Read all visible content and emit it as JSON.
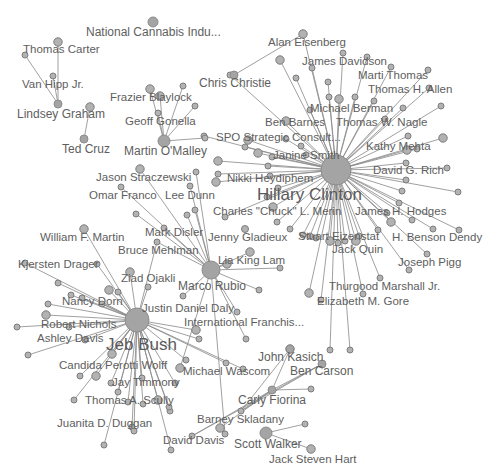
{
  "diagram": {
    "type": "network-graph",
    "colors": {
      "node_fill": "#b2b2b2",
      "node_stroke": "#7c7c7c",
      "edge": "#8a8a8a",
      "label": "#5e5e5e",
      "background": "#ffffff"
    },
    "hubs": [
      {
        "id": "clinton",
        "label": "Hillary Clinton",
        "x": 336,
        "y": 170,
        "r": 15,
        "lx": 257,
        "ly": 200,
        "size": "big"
      },
      {
        "id": "bush",
        "label": "Jeb Bush",
        "x": 137,
        "y": 320,
        "r": 12,
        "lx": 106,
        "ly": 350,
        "size": "big"
      },
      {
        "id": "rubio",
        "label": "Marco Rubio",
        "x": 211,
        "y": 270,
        "r": 9,
        "lx": 178,
        "ly": 290,
        "size": "mid"
      },
      {
        "id": "omalley",
        "label": "Martin O'Malley",
        "x": 164,
        "y": 141,
        "r": 6,
        "lx": 124,
        "ly": 155,
        "size": "mid"
      },
      {
        "id": "graham",
        "label": "Lindsey Graham",
        "x": 58,
        "y": 104,
        "r": 4,
        "lx": 17,
        "ly": 118,
        "size": "mid"
      },
      {
        "id": "cruz",
        "label": "Ted Cruz",
        "x": 84,
        "y": 139,
        "r": 4,
        "lx": 62,
        "ly": 153,
        "size": "mid"
      },
      {
        "id": "christie",
        "label": "Chris Christie",
        "x": 234,
        "y": 75,
        "r": 4,
        "lx": 199,
        "ly": 87,
        "size": "mid"
      },
      {
        "id": "fiorina",
        "label": "Carly Fiorina",
        "x": 272,
        "y": 390,
        "r": 4,
        "lx": 238,
        "ly": 404,
        "size": "mid"
      },
      {
        "id": "walker",
        "label": "Scott Walker",
        "x": 266,
        "y": 433,
        "r": 6,
        "lx": 234,
        "ly": 448,
        "size": "mid"
      },
      {
        "id": "kasich",
        "label": "John Kasich",
        "x": 290,
        "y": 349,
        "r": 4,
        "lx": 258,
        "ly": 361,
        "size": "mid"
      },
      {
        "id": "carson",
        "label": "Ben Carson",
        "x": 322,
        "y": 364,
        "r": 4,
        "lx": 290,
        "ly": 375,
        "size": "mid"
      },
      {
        "id": "cannabis",
        "label": "National Cannabis Indu...",
        "x": 153,
        "y": 22,
        "r": 5,
        "lx": 86,
        "ly": 36,
        "size": "mid"
      }
    ],
    "labels": [
      {
        "text": "Thomas Carter",
        "x": 23,
        "y": 53,
        "node": [
          58,
          42
        ]
      },
      {
        "text": "Van Hipp Jr.",
        "x": 22,
        "y": 88,
        "node": [
          53,
          76
        ]
      },
      {
        "text": "Frazier Blaylock",
        "x": 110,
        "y": 101,
        "node": [
          150,
          89
        ]
      },
      {
        "text": "Geoff Gonella",
        "x": 125,
        "y": 125,
        "node": [
          158,
          113
        ]
      },
      {
        "text": "SPO Strategic Consult...",
        "x": 216,
        "y": 141,
        "node": [
          204,
          136
        ]
      },
      {
        "text": "Alan Eisenberg",
        "x": 268,
        "y": 46,
        "node": [
          303,
          34
        ]
      },
      {
        "text": "James Davidson",
        "x": 302,
        "y": 65,
        "node": [
          343,
          53
        ]
      },
      {
        "text": "Marti Thomas",
        "x": 358,
        "y": 79,
        "node": [
          391,
          67
        ]
      },
      {
        "text": "Thomas H. Allen",
        "x": 368,
        "y": 93,
        "node": [
          429,
          88
        ]
      },
      {
        "text": "Michael Berman",
        "x": 310,
        "y": 112,
        "node": [
          310,
          110
        ]
      },
      {
        "text": "Ben Barnes",
        "x": 265,
        "y": 126,
        "node": [
          286,
          121
        ]
      },
      {
        "text": "Thomas W. Nagle",
        "x": 336,
        "y": 126,
        "node": [
          385,
          119
        ]
      },
      {
        "text": "Kathy Mehta",
        "x": 366,
        "y": 150,
        "node": [
          417,
          149
        ]
      },
      {
        "text": "Janine Smith",
        "x": 273,
        "y": 159,
        "node": [
          272,
          157
        ]
      },
      {
        "text": "David G. Rich",
        "x": 373,
        "y": 174,
        "node": [
          447,
          168
        ]
      },
      {
        "text": "Nikki Heydiphem",
        "x": 227,
        "y": 182,
        "node": [
          216,
          182
        ]
      },
      {
        "text": "Charles \"Chuck\" L. Merin",
        "x": 213,
        "y": 215,
        "node": [
          225,
          217
        ]
      },
      {
        "text": "James H. Hodges",
        "x": 355,
        "y": 215,
        "node": [
          387,
          213
        ]
      },
      {
        "text": "Jenny Gladieux",
        "x": 208,
        "y": 241,
        "node": [
          245,
          229
        ]
      },
      {
        "text": "Stuart Eizenstat",
        "x": 298,
        "y": 240,
        "node": [
          310,
          236
        ]
      },
      {
        "text": "H. Benson Dendy",
        "x": 392,
        "y": 241,
        "node": [
          433,
          229
        ]
      },
      {
        "text": "Jack Quin",
        "x": 332,
        "y": 253,
        "node": [
          356,
          241
        ]
      },
      {
        "text": "Lia King Lam",
        "x": 218,
        "y": 264,
        "node": [
          250,
          252
        ]
      },
      {
        "text": "Joseph Pigg",
        "x": 398,
        "y": 266,
        "node": [
          427,
          254
        ]
      },
      {
        "text": "Thurgood Marshall Jr.",
        "x": 329,
        "y": 290,
        "node": [
          380,
          278
        ]
      },
      {
        "text": "Elizabeth M. Gore",
        "x": 317,
        "y": 305,
        "node": [
          363,
          294
        ]
      },
      {
        "text": "Jason Straczewski",
        "x": 96,
        "y": 181,
        "node": [
          140,
          169
        ]
      },
      {
        "text": "Omar Franco",
        "x": 89,
        "y": 199,
        "node": [
          121,
          187
        ]
      },
      {
        "text": "Lee Dunn",
        "x": 165,
        "y": 199,
        "node": [
          190,
          186
        ]
      },
      {
        "text": "Mark Disler",
        "x": 145,
        "y": 236,
        "node": [
          187,
          215
        ]
      },
      {
        "text": "William F. Martin",
        "x": 40,
        "y": 241,
        "node": [
          84,
          229
        ]
      },
      {
        "text": "Bruce Mehlman",
        "x": 118,
        "y": 254,
        "node": [
          157,
          242
        ]
      },
      {
        "text": "Kjersten Drager",
        "x": 18,
        "y": 268,
        "node": [
          97,
          264
        ]
      },
      {
        "text": "Ziad Ojakli",
        "x": 121,
        "y": 282,
        "node": [
          130,
          272
        ]
      },
      {
        "text": "Nancy Dorn",
        "x": 62,
        "y": 305,
        "node": [
          71,
          295
        ]
      },
      {
        "text": "Justin Daniel Daly",
        "x": 142,
        "y": 312,
        "node": [
          183,
          296
        ]
      },
      {
        "text": "International Franchis...",
        "x": 184,
        "y": 326,
        "node": [
          237,
          312
        ]
      },
      {
        "text": "Robert Nichols",
        "x": 41,
        "y": 328,
        "node": [
          69,
          327
        ]
      },
      {
        "text": "Ashley Davis",
        "x": 37,
        "y": 342,
        "node": [
          85,
          340
        ]
      },
      {
        "text": "Candida Perotti Wolff",
        "x": 59,
        "y": 369,
        "node": [
          112,
          354
        ]
      },
      {
        "text": "Michael Wascom",
        "x": 183,
        "y": 375,
        "node": [
          226,
          363
        ]
      },
      {
        "text": "Jay Timmony",
        "x": 112,
        "y": 386,
        "node": [
          175,
          383
        ]
      },
      {
        "text": "Thomas A. Scully",
        "x": 85,
        "y": 404,
        "node": [
          74,
          400
        ]
      },
      {
        "text": "Juanita D. Duggan",
        "x": 57,
        "y": 427,
        "node": [
          132,
          427
        ]
      },
      {
        "text": "Barney Skladany",
        "x": 197,
        "y": 423,
        "node": [
          241,
          411
        ]
      },
      {
        "text": "David Davis",
        "x": 163,
        "y": 444,
        "node": [
          192,
          436
        ]
      },
      {
        "text": "Jack Steven Hart",
        "x": 269,
        "y": 463,
        "node": [
          311,
          449
        ]
      }
    ],
    "hub_edges": {
      "clinton": [
        [
          303,
          34
        ],
        [
          343,
          53
        ],
        [
          391,
          67
        ],
        [
          429,
          88
        ],
        [
          310,
          110
        ],
        [
          286,
          121
        ],
        [
          385,
          119
        ],
        [
          417,
          149
        ],
        [
          272,
          157
        ],
        [
          447,
          168
        ],
        [
          216,
          182
        ],
        [
          225,
          217
        ],
        [
          387,
          213
        ],
        [
          310,
          236
        ],
        [
          433,
          229
        ],
        [
          356,
          241
        ],
        [
          427,
          254
        ],
        [
          380,
          278
        ],
        [
          363,
          294
        ],
        [
          204,
          136
        ],
        [
          280,
          60
        ],
        [
          367,
          57
        ],
        [
          328,
          82
        ],
        [
          428,
          70
        ],
        [
          441,
          106
        ],
        [
          443,
          138
        ],
        [
          458,
          192
        ],
        [
          459,
          230
        ],
        [
          412,
          220
        ],
        [
          409,
          270
        ],
        [
          248,
          140
        ],
        [
          230,
          75
        ],
        [
          296,
          78
        ],
        [
          312,
          68
        ],
        [
          329,
          97
        ],
        [
          339,
          99
        ],
        [
          355,
          97
        ],
        [
          374,
          101
        ],
        [
          403,
          108
        ],
        [
          408,
          136
        ],
        [
          407,
          150
        ],
        [
          406,
          163
        ],
        [
          406,
          180
        ],
        [
          402,
          191
        ],
        [
          399,
          203
        ],
        [
          391,
          222
        ],
        [
          378,
          230
        ],
        [
          359,
          236
        ],
        [
          345,
          241
        ],
        [
          338,
          243
        ],
        [
          330,
          241
        ],
        [
          316,
          238
        ],
        [
          303,
          235
        ],
        [
          290,
          229
        ],
        [
          277,
          222
        ],
        [
          273,
          207
        ],
        [
          267,
          197
        ],
        [
          278,
          188
        ],
        [
          270,
          176
        ],
        [
          268,
          166
        ],
        [
          258,
          153
        ],
        [
          245,
          147
        ],
        [
          301,
          146
        ],
        [
          306,
          155
        ],
        [
          286,
          139
        ],
        [
          218,
          161
        ],
        [
          218,
          174
        ],
        [
          350,
          350
        ],
        [
          330,
          350
        ],
        [
          321,
          300
        ],
        [
          309,
          293
        ]
      ],
      "bush": [
        [
          84,
          229
        ],
        [
          97,
          264
        ],
        [
          71,
          295
        ],
        [
          69,
          327
        ],
        [
          85,
          340
        ],
        [
          112,
          354
        ],
        [
          175,
          383
        ],
        [
          74,
          400
        ],
        [
          132,
          427
        ],
        [
          226,
          363
        ],
        [
          130,
          272
        ],
        [
          157,
          242
        ],
        [
          25,
          263
        ],
        [
          17,
          327
        ],
        [
          28,
          355
        ],
        [
          46,
          315
        ],
        [
          48,
          304
        ],
        [
          82,
          298
        ],
        [
          58,
          283
        ],
        [
          80,
          376
        ],
        [
          96,
          376
        ],
        [
          111,
          383
        ],
        [
          118,
          392
        ],
        [
          128,
          402
        ],
        [
          143,
          404
        ],
        [
          158,
          400
        ],
        [
          170,
          411
        ],
        [
          134,
          431
        ],
        [
          104,
          445
        ],
        [
          171,
          450
        ],
        [
          196,
          330
        ],
        [
          199,
          339
        ],
        [
          142,
          378
        ],
        [
          186,
          360
        ],
        [
          243,
          369
        ],
        [
          109,
          290
        ],
        [
          118,
          292
        ],
        [
          148,
          287
        ],
        [
          169,
          407
        ],
        [
          102,
          304
        ]
      ],
      "rubio": [
        [
          140,
          169
        ],
        [
          121,
          187
        ],
        [
          190,
          186
        ],
        [
          187,
          215
        ],
        [
          157,
          242
        ],
        [
          250,
          252
        ],
        [
          183,
          296
        ],
        [
          237,
          312
        ],
        [
          136,
          214
        ],
        [
          196,
          172
        ],
        [
          227,
          264
        ],
        [
          164,
          228
        ],
        [
          195,
          210
        ],
        [
          259,
          290
        ],
        [
          246,
          339
        ],
        [
          180,
          368
        ],
        [
          225,
          434
        ],
        [
          280,
          268
        ]
      ],
      "omalley": [
        [
          150,
          89
        ],
        [
          158,
          113
        ],
        [
          183,
          86
        ],
        [
          195,
          106
        ],
        [
          205,
          138
        ],
        [
          160,
          96
        ]
      ],
      "graham": [
        [
          58,
          42
        ],
        [
          53,
          76
        ],
        [
          25,
          55
        ]
      ],
      "cruz": [
        [
          90,
          107
        ]
      ],
      "christie": [
        [
          303,
          34
        ]
      ],
      "fiorina": [
        [
          290,
          349
        ],
        [
          322,
          364
        ],
        [
          311,
          389
        ],
        [
          192,
          436
        ],
        [
          241,
          411
        ],
        [
          220,
          428
        ]
      ],
      "walker": [
        [
          311,
          449
        ],
        [
          305,
          424
        ]
      ],
      "kasich": [
        [
          241,
          411
        ]
      ],
      "carson": [
        [
          192,
          436
        ],
        [
          241,
          411
        ]
      ]
    }
  }
}
